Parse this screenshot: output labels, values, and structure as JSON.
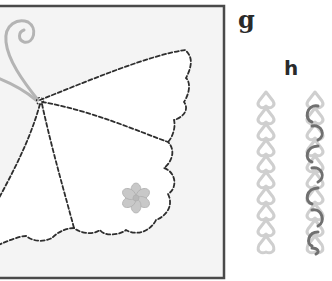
{
  "figure": {
    "panel_g_label": "g",
    "panel_h_label": "h",
    "colors": {
      "frame": "#4a4a4a",
      "panel_bg": "#f4f4f4",
      "wing_fill": "#ffffff",
      "stitch": "#2e2e2e",
      "antenna": "#b4b4b4",
      "flower": "#c8c8c8",
      "chain_light": "#cfcfcf",
      "chain_dark": "#707070"
    }
  }
}
